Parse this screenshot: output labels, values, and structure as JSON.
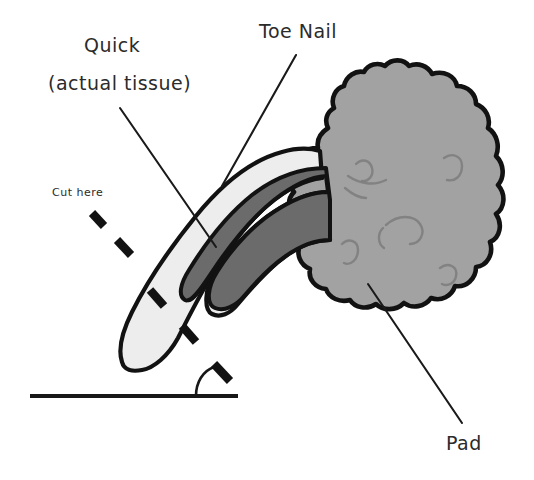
{
  "diagram": {
    "background_color": "#ffffff",
    "width": 534,
    "height": 480
  },
  "labels": {
    "quick_line1": "Quick",
    "quick_line2": "(actual tissue)",
    "toe_nail": "Toe Nail",
    "cut_here": "Cut here",
    "pad": "Pad"
  },
  "colors": {
    "ink": "#121212",
    "text": "#2b2b2b",
    "nail_body": "#ededed",
    "quick_tissue": "#6b6b6b",
    "pad_fill": "#a2a2a2",
    "pad_texture": "#7d7d7d",
    "ground": "#171717",
    "page_background": "#ffffff"
  },
  "parts": [
    {
      "name": "toe-nail",
      "label": "Toe Nail",
      "fill": "#ededed",
      "description": "outer claw sheath"
    },
    {
      "name": "quick",
      "label": "Quick (actual tissue)",
      "fill": "#6b6b6b",
      "description": "living tissue inside the nail"
    },
    {
      "name": "pad",
      "label": "Pad",
      "fill": "#a2a2a2",
      "description": "toe pad behind the nail"
    }
  ],
  "annotations": {
    "cut_line_style": "dashed",
    "cut_line_label": "Cut here",
    "ground_line_present": true,
    "angle_arc_present": true
  }
}
